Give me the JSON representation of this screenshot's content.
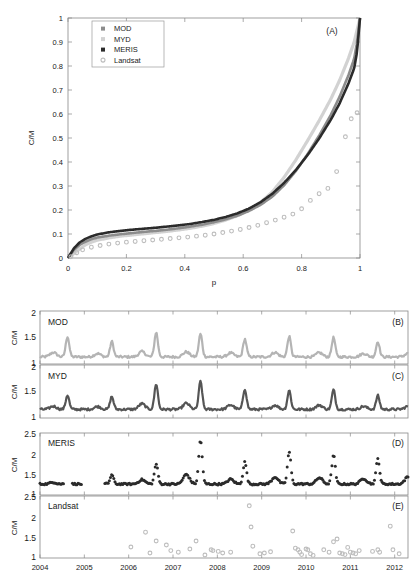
{
  "figure": {
    "background": "#ffffff",
    "colors": {
      "MOD": "#b4b4b4",
      "MYD": "#555555",
      "MERIS": "#2b2b2b",
      "Landsat": "#bdbdbd",
      "axis": "#8a8a8a",
      "text": "#1a1a1a"
    }
  },
  "panelA": {
    "label": "(A)",
    "legend": [
      {
        "name": "MOD",
        "color": "#8c8c8c",
        "marker": "filled-square"
      },
      {
        "name": "MYD",
        "color": "#d2d2d2",
        "marker": "filled-square"
      },
      {
        "name": "MERIS",
        "color": "#2b2b2b",
        "marker": "filled-square"
      },
      {
        "name": "Landsat",
        "color": "#bdbdbd",
        "marker": "open-circle"
      }
    ]
  },
  "panelB": {
    "label": "(B)",
    "series_label": "MOD"
  },
  "panelC": {
    "label": "(C)",
    "series_label": "MYD"
  },
  "panelD": {
    "label": "(D)",
    "series_label": "MERIS"
  },
  "panelE": {
    "label": "(E)",
    "series_label": "Landsat"
  },
  "chart_data": [
    {
      "type": "line",
      "panel": "A",
      "title": "(A)",
      "xlabel": "p",
      "ylabel": "C/M",
      "xlim": [
        0,
        1
      ],
      "ylim": [
        0,
        1
      ],
      "xticks": [
        0,
        0.2,
        0.4,
        0.6,
        0.8,
        1
      ],
      "xticklabels": [
        "0",
        "0.2",
        "0.4",
        "0.6",
        "0.8",
        "1"
      ],
      "yticks": [
        0,
        0.1,
        0.2,
        0.3,
        0.4,
        0.5,
        0.6,
        0.7,
        0.8,
        0.9,
        1
      ],
      "yticklabels": [
        "0",
        "0.1",
        "0.2",
        "0.3",
        "0.4",
        "0.5",
        "0.6",
        "0.7",
        "0.8",
        "0.9",
        "1"
      ],
      "grid": false,
      "legend_position": "upper-left",
      "series": [
        {
          "name": "MOD",
          "color": "#8c8c8c",
          "x": [
            0,
            0.02,
            0.04,
            0.06,
            0.08,
            0.1,
            0.14,
            0.18,
            0.22,
            0.26,
            0.3,
            0.34,
            0.38,
            0.42,
            0.46,
            0.5,
            0.54,
            0.58,
            0.62,
            0.66,
            0.7,
            0.74,
            0.78,
            0.82,
            0.86,
            0.9,
            0.93,
            0.96,
            0.98,
            0.99,
            1.0
          ],
          "y": [
            0,
            0.033,
            0.055,
            0.068,
            0.078,
            0.085,
            0.093,
            0.099,
            0.104,
            0.109,
            0.113,
            0.118,
            0.124,
            0.131,
            0.139,
            0.149,
            0.161,
            0.176,
            0.196,
            0.222,
            0.256,
            0.303,
            0.362,
            0.432,
            0.51,
            0.596,
            0.672,
            0.76,
            0.83,
            0.9,
            1.0
          ]
        },
        {
          "name": "MYD",
          "color": "#d2d2d2",
          "x": [
            0,
            0.02,
            0.04,
            0.06,
            0.08,
            0.1,
            0.14,
            0.18,
            0.22,
            0.26,
            0.3,
            0.34,
            0.38,
            0.42,
            0.46,
            0.5,
            0.54,
            0.58,
            0.62,
            0.66,
            0.7,
            0.74,
            0.78,
            0.82,
            0.86,
            0.9,
            0.93,
            0.96,
            0.98,
            0.99,
            1.0
          ],
          "y": [
            0,
            0.018,
            0.038,
            0.055,
            0.066,
            0.074,
            0.084,
            0.091,
            0.096,
            0.101,
            0.106,
            0.111,
            0.117,
            0.124,
            0.133,
            0.144,
            0.158,
            0.176,
            0.2,
            0.232,
            0.276,
            0.336,
            0.408,
            0.488,
            0.572,
            0.662,
            0.74,
            0.83,
            0.9,
            0.95,
            1.0
          ]
        },
        {
          "name": "MERIS",
          "color": "#2b2b2b",
          "x": [
            0,
            0.02,
            0.04,
            0.06,
            0.08,
            0.1,
            0.14,
            0.18,
            0.22,
            0.26,
            0.3,
            0.34,
            0.38,
            0.42,
            0.46,
            0.5,
            0.54,
            0.58,
            0.62,
            0.66,
            0.7,
            0.74,
            0.78,
            0.82,
            0.86,
            0.9,
            0.93,
            0.96,
            0.98,
            0.99,
            1.0
          ],
          "y": [
            0,
            0.04,
            0.065,
            0.08,
            0.09,
            0.098,
            0.107,
            0.113,
            0.118,
            0.122,
            0.126,
            0.131,
            0.136,
            0.142,
            0.15,
            0.159,
            0.171,
            0.186,
            0.206,
            0.233,
            0.268,
            0.313,
            0.366,
            0.428,
            0.498,
            0.576,
            0.644,
            0.726,
            0.79,
            0.86,
            1.0
          ]
        },
        {
          "name": "Landsat",
          "color": "#bdbdbd",
          "marker": "open-circle",
          "x": [
            0.01,
            0.03,
            0.05,
            0.08,
            0.11,
            0.14,
            0.17,
            0.2,
            0.23,
            0.26,
            0.29,
            0.32,
            0.35,
            0.38,
            0.41,
            0.44,
            0.47,
            0.5,
            0.53,
            0.56,
            0.59,
            0.62,
            0.65,
            0.68,
            0.71,
            0.74,
            0.77,
            0.8,
            0.83,
            0.86,
            0.89,
            0.92,
            0.95,
            0.97,
            0.99
          ],
          "y": [
            0.005,
            0.022,
            0.034,
            0.045,
            0.052,
            0.058,
            0.062,
            0.066,
            0.069,
            0.072,
            0.075,
            0.078,
            0.081,
            0.084,
            0.087,
            0.091,
            0.095,
            0.1,
            0.106,
            0.112,
            0.119,
            0.127,
            0.136,
            0.147,
            0.158,
            0.17,
            0.183,
            0.205,
            0.24,
            0.268,
            0.29,
            0.36,
            0.505,
            0.58,
            0.605
          ]
        }
      ]
    },
    {
      "type": "line",
      "panel": "B",
      "title": "MOD",
      "ylabel": "C/M",
      "xlabel": "",
      "xlim": [
        2004,
        2012.3
      ],
      "ylim": [
        1,
        2
      ],
      "yticks": [
        1,
        1.5,
        2
      ],
      "yticklabels": [
        "1",
        "1.5",
        "2"
      ],
      "xticks": [
        2004,
        2005,
        2006,
        2007,
        2008,
        2009,
        2010,
        2011,
        2012
      ],
      "xticklabels": [
        "2004",
        "2005",
        "2006",
        "2007",
        "2008",
        "2009",
        "2010",
        "2011",
        "2012"
      ],
      "color": "#b4b4b4",
      "peaks": [
        1.52,
        1.42,
        1.6,
        1.57,
        1.47,
        1.52,
        1.5,
        1.42
      ],
      "baseline": 1.12
    },
    {
      "type": "line",
      "panel": "C",
      "title": "MYD",
      "ylabel": "C/M",
      "xlabel": "",
      "xlim": [
        2004,
        2012.3
      ],
      "ylim": [
        1,
        2
      ],
      "yticks": [
        1,
        1.5,
        2
      ],
      "yticklabels": [
        "1",
        "1.5",
        "2"
      ],
      "color": "#555555",
      "peaks": [
        1.43,
        1.4,
        1.65,
        1.7,
        1.55,
        1.52,
        1.53,
        1.42
      ],
      "baseline": 1.15
    },
    {
      "type": "scatter",
      "panel": "D",
      "title": "MERIS",
      "ylabel": "C/M",
      "xlabel": "",
      "xlim": [
        2004,
        2012.3
      ],
      "ylim": [
        1,
        2.5
      ],
      "yticks": [
        1,
        1.5,
        2,
        2.5
      ],
      "yticklabels": [
        "1",
        "1.5",
        "2",
        "2.5"
      ],
      "color": "#2b2b2b",
      "peaks": [
        1.45,
        1.48,
        1.75,
        2.35,
        1.8,
        2.05,
        1.97,
        1.88,
        2.07,
        1.85
      ],
      "baseline": 1.25
    },
    {
      "type": "scatter",
      "panel": "E",
      "title": "Landsat",
      "ylabel": "C/M",
      "xlabel": "",
      "xlim": [
        2004,
        2012.3
      ],
      "ylim": [
        1,
        2.5
      ],
      "yticks": [
        1,
        1.5,
        2,
        2.5
      ],
      "yticklabels": [
        "1",
        "1.5",
        "2",
        "2.5"
      ],
      "color": "#bdbdbd",
      "points": [
        [
          2006.05,
          1.25
        ],
        [
          2006.38,
          1.62
        ],
        [
          2006.48,
          1.1
        ],
        [
          2006.62,
          1.4
        ],
        [
          2006.85,
          1.3
        ],
        [
          2006.95,
          1.16
        ],
        [
          2007.12,
          1.12
        ],
        [
          2007.38,
          1.2
        ],
        [
          2007.52,
          1.4
        ],
        [
          2007.72,
          1.05
        ],
        [
          2007.86,
          1.18
        ],
        [
          2007.9,
          1.16
        ],
        [
          2008.02,
          1.14
        ],
        [
          2008.12,
          1.1
        ],
        [
          2008.3,
          1.12
        ],
        [
          2008.72,
          2.28
        ],
        [
          2008.76,
          1.75
        ],
        [
          2008.8,
          1.27
        ],
        [
          2008.96,
          1.08
        ],
        [
          2009.06,
          1.1
        ],
        [
          2009.2,
          1.13
        ],
        [
          2009.7,
          1.65
        ],
        [
          2009.76,
          1.22
        ],
        [
          2009.82,
          1.18
        ],
        [
          2009.86,
          1.12
        ],
        [
          2009.9,
          1.06
        ],
        [
          2010.0,
          1.2
        ],
        [
          2010.04,
          1.18
        ],
        [
          2010.1,
          1.08
        ],
        [
          2010.16,
          1.04
        ],
        [
          2010.4,
          1.18
        ],
        [
          2010.52,
          1.12
        ],
        [
          2010.62,
          1.38
        ],
        [
          2010.7,
          1.45
        ],
        [
          2010.76,
          1.1
        ],
        [
          2010.82,
          1.08
        ],
        [
          2010.88,
          1.06
        ],
        [
          2010.94,
          1.24
        ],
        [
          2011.0,
          1.12
        ],
        [
          2011.06,
          1.1
        ],
        [
          2011.12,
          1.08
        ],
        [
          2011.2,
          1.16
        ],
        [
          2011.5,
          1.14
        ],
        [
          2011.62,
          1.18
        ],
        [
          2011.66,
          1.12
        ],
        [
          2011.9,
          1.77
        ],
        [
          2011.96,
          1.18
        ],
        [
          2012.1,
          1.08
        ]
      ]
    }
  ]
}
